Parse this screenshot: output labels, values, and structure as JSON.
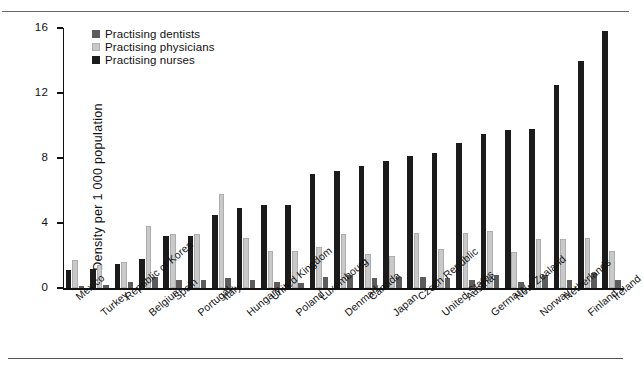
{
  "chart_data": {
    "type": "bar",
    "title": "",
    "xlabel": "",
    "ylabel": "Density per 1 000 population",
    "ylim": [
      0,
      16
    ],
    "yticks": [
      "0",
      "4",
      "8",
      "12",
      "16"
    ],
    "grid": false,
    "legend_position": "top-left",
    "bar_order": [
      "Practising nurses",
      "Practising physicians",
      "Practising dentists"
    ],
    "categories": [
      "Mexico",
      "Turkey",
      "Republic of Korea",
      "Belgium",
      "Spain",
      "Portugal",
      "Italy",
      "Hungary",
      "United Kingdom",
      "Poland",
      "Luxembourg",
      "Denmark",
      "Canada",
      "Japan",
      "Czech Republic",
      "United States",
      "Austria",
      "Germany",
      "New Zealand",
      "Norway",
      "Netherlands",
      "Finland",
      "Ireland"
    ],
    "series": [
      {
        "name": "Practising dentists",
        "color": "#5c5c5c",
        "values": [
          0.1,
          0.2,
          0.4,
          0.7,
          0.5,
          0.5,
          0.6,
          0.5,
          0.4,
          0.3,
          0.7,
          0.8,
          0.6,
          0.7,
          0.7,
          0.6,
          0.5,
          0.8,
          0.4,
          0.8,
          0.5,
          0.9,
          0.5
        ]
      },
      {
        "name": "Practising physicians",
        "color": "#c9c9c9",
        "values": [
          1.7,
          1.4,
          1.6,
          3.8,
          3.3,
          3.3,
          5.8,
          3.1,
          2.3,
          2.3,
          2.5,
          3.3,
          2.1,
          2.0,
          3.4,
          2.4,
          3.4,
          3.5,
          2.2,
          3.0,
          3.0,
          3.1,
          2.3
        ]
      },
      {
        "name": "Practising nurses",
        "color": "#1b1b1b",
        "values": [
          1.1,
          1.2,
          1.5,
          1.8,
          3.2,
          3.2,
          4.5,
          4.9,
          5.1,
          5.1,
          7.0,
          7.2,
          7.5,
          7.8,
          8.1,
          8.3,
          8.9,
          9.5,
          9.7,
          9.8,
          12.5,
          14.0,
          15.8
        ]
      }
    ]
  },
  "legend": {
    "items": [
      {
        "label": "Practising dentists",
        "color": "#5c5c5c"
      },
      {
        "label": "Practising physicians",
        "color": "#c9c9c9"
      },
      {
        "label": "Practising nurses",
        "color": "#1b1b1b"
      }
    ]
  }
}
